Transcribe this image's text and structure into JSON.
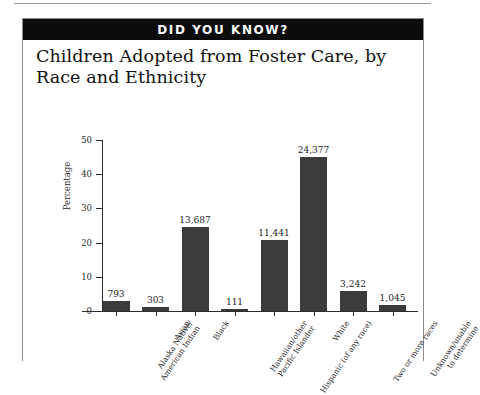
{
  "banner": {
    "text": "DID YOU KNOW?"
  },
  "title": "Children Adopted from Foster Care, by Race and Ethnicity",
  "axis": {
    "y_label": "Percentage",
    "y_ticks": [
      "0",
      "10",
      "20",
      "30",
      "40",
      "50"
    ]
  },
  "chart_data": {
    "type": "bar",
    "title": "Children Adopted from Foster Care, by Race and Ethnicity",
    "xlabel": "",
    "ylabel": "Percentage",
    "ylim": [
      0,
      50
    ],
    "grid": false,
    "legend": "none",
    "categories": [
      "Alaska Native/\nAmerican Indian",
      "Asian",
      "Black",
      "Hawaiian/other\nPacific Islander",
      "Hispanic (of any race)",
      "White",
      "Two or more races",
      "Unknown/unable\nto determine"
    ],
    "data_labels": [
      "793",
      "303",
      "13,687",
      "111",
      "11,441",
      "24,377",
      "3,242",
      "1,045"
    ],
    "counts": [
      793,
      303,
      13687,
      111,
      11441,
      24377,
      3242,
      1045
    ],
    "values": [
      3.0,
      1.2,
      24.6,
      0.5,
      20.8,
      44.9,
      5.9,
      1.9
    ]
  }
}
